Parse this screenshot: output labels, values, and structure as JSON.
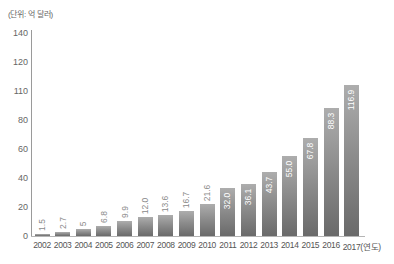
{
  "chart_data": {
    "type": "bar",
    "title": "",
    "unit_label": "(단위: 억 달러)",
    "xlabel": "(연도)",
    "ylabel": "",
    "ylim": [
      0,
      140
    ],
    "grid": false,
    "legend": null,
    "y_ticks": [
      {
        "label": "0",
        "y": 236
      },
      {
        "label": "20",
        "y": 207
      },
      {
        "label": "40",
        "y": 178
      },
      {
        "label": "60",
        "y": 149
      },
      {
        "label": "80",
        "y": 120
      },
      {
        "label": "110",
        "y": 91
      },
      {
        "label": "120",
        "y": 62
      },
      {
        "label": "140",
        "y": 33
      }
    ],
    "categories": [
      "2002",
      "2003",
      "2004",
      "2005",
      "2006",
      "2007",
      "2008",
      "2009",
      "2010",
      "2011",
      "2012",
      "2013",
      "2014",
      "2015",
      "2016",
      "2017(연도)"
    ],
    "values": [
      1.5,
      2.7,
      5,
      6.8,
      9.9,
      12.0,
      13.6,
      16.7,
      21.6,
      32.0,
      36.1,
      43.7,
      55.0,
      67.8,
      88.3,
      116.9
    ],
    "value_labels": [
      "1.5",
      "2.7",
      "5",
      "6.8",
      "9.9",
      "12.0",
      "13.6",
      "16.7",
      "21.6",
      "32.0",
      "36.1",
      "43.7",
      "55.0",
      "67.8",
      "88.3",
      "116.9"
    ],
    "bar_top_px": [
      234,
      232,
      229,
      226,
      221,
      217,
      215,
      211,
      204,
      188,
      184,
      172,
      156,
      138,
      108,
      85
    ],
    "label_inside_from_index": 9,
    "colors": {
      "bar_top": "#adadad",
      "bar_bottom": "#6a6a6a",
      "axis": "#9a9a9a",
      "label_outside": "#8a8a8a",
      "label_inside": "#ffffff"
    }
  }
}
